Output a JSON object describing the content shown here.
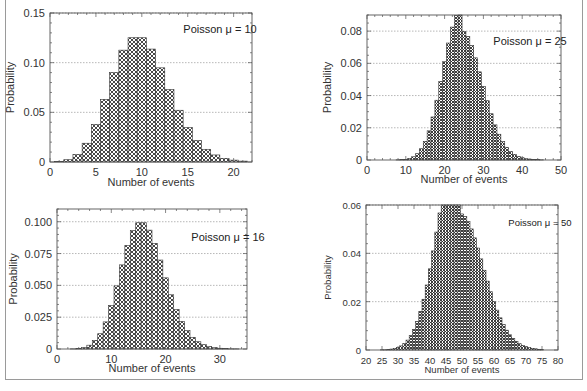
{
  "chart_data": [
    {
      "type": "bar",
      "title": "",
      "annotation": "Poisson μ = 10",
      "mu": 10,
      "xlabel": "Number of events",
      "ylabel": "Probability",
      "xlim": [
        0,
        22
      ],
      "ylim": [
        0,
        0.15
      ],
      "xticks": [
        0,
        5,
        10,
        15,
        20
      ],
      "xtick_labels": [
        "0",
        "5",
        "10",
        "15",
        "20"
      ],
      "yticks": [
        0,
        0.05,
        0.1,
        0.15
      ],
      "ytick_labels": [
        "0",
        "0.05",
        "0.10",
        "0.15"
      ],
      "grid": "horizontal-dotted",
      "x": [
        1,
        2,
        3,
        4,
        5,
        6,
        7,
        8,
        9,
        10,
        11,
        12,
        13,
        14,
        15,
        16,
        17,
        18,
        19,
        20,
        21
      ],
      "values": [
        0.0005,
        0.0023,
        0.0076,
        0.0189,
        0.0378,
        0.0631,
        0.0901,
        0.1126,
        0.1251,
        0.1251,
        0.1137,
        0.0948,
        0.0729,
        0.0521,
        0.0347,
        0.0217,
        0.0128,
        0.0071,
        0.0037,
        0.0019,
        0.0009
      ]
    },
    {
      "type": "bar",
      "title": "",
      "annotation": "Poisson μ = 25",
      "mu": 25,
      "xlabel": "Number of events",
      "ylabel": "Probability",
      "xlim": [
        0,
        50
      ],
      "ylim": [
        0,
        0.09
      ],
      "xticks": [
        0,
        10,
        20,
        30,
        40,
        50
      ],
      "xtick_labels": [
        "0",
        "10",
        "20",
        "30",
        "40",
        "50"
      ],
      "yticks": [
        0,
        0.02,
        0.04,
        0.06,
        0.08
      ],
      "ytick_labels": [
        "0",
        "0.02",
        "0.04",
        "0.06",
        "0.08"
      ],
      "grid": "horizontal-dotted",
      "x": [
        8,
        9,
        10,
        11,
        12,
        13,
        14,
        15,
        16,
        17,
        18,
        19,
        20,
        21,
        22,
        23,
        24,
        25,
        26,
        27,
        28,
        29,
        30,
        31,
        32,
        33,
        34,
        35,
        36,
        37,
        38,
        39,
        40,
        41,
        42,
        43,
        44,
        45
      ],
      "values": [
        0.0001,
        0.0002,
        0.0004,
        0.001,
        0.002,
        0.0039,
        0.007,
        0.0116,
        0.0181,
        0.0267,
        0.0371,
        0.0488,
        0.061,
        0.0726,
        0.0825,
        0.0897,
        0.0934,
        0.0798,
        0.0767,
        0.071,
        0.0634,
        0.0547,
        0.0456,
        0.0368,
        0.0287,
        0.0218,
        0.016,
        0.0114,
        0.0079,
        0.0053,
        0.0035,
        0.0022,
        0.0014,
        0.0008,
        0.0005,
        0.0003,
        0.0002,
        0.0001
      ]
    },
    {
      "type": "bar",
      "title": "",
      "annotation": "Poisson μ = 16",
      "mu": 16,
      "xlabel": "Number of events",
      "ylabel": "Probability",
      "xlim": [
        0,
        35
      ],
      "ylim": [
        0,
        0.11
      ],
      "xticks": [
        0,
        10,
        20,
        30
      ],
      "xtick_labels": [
        "0",
        "10",
        "20",
        "30"
      ],
      "yticks": [
        0,
        0.025,
        0.05,
        0.075,
        0.1
      ],
      "ytick_labels": [
        "0",
        "0.025",
        "0.050",
        "0.075",
        "0.100"
      ],
      "grid": "horizontal-dotted",
      "x": [
        3,
        4,
        5,
        6,
        7,
        8,
        9,
        10,
        11,
        12,
        13,
        14,
        15,
        16,
        17,
        18,
        19,
        20,
        21,
        22,
        23,
        24,
        25,
        26,
        27,
        28,
        29,
        30,
        31,
        32,
        33
      ],
      "values": [
        0.0001,
        0.0004,
        0.0011,
        0.003,
        0.0068,
        0.012,
        0.0213,
        0.0341,
        0.0496,
        0.0661,
        0.0814,
        0.093,
        0.0992,
        0.0992,
        0.0934,
        0.083,
        0.0699,
        0.0559,
        0.0426,
        0.031,
        0.0216,
        0.0144,
        0.0092,
        0.0057,
        0.0034,
        0.0019,
        0.0011,
        0.0006,
        0.0003,
        0.0001,
        0.0001
      ]
    },
    {
      "type": "bar",
      "title": "",
      "annotation": "Poisson μ = 50",
      "mu": 50,
      "xlabel": "Number of events",
      "ylabel": "Probability",
      "xlim": [
        20,
        80
      ],
      "ylim": [
        0,
        0.06
      ],
      "xticks": [
        20,
        25,
        30,
        35,
        40,
        45,
        50,
        55,
        60,
        65,
        70,
        75,
        80
      ],
      "xtick_labels": [
        "20",
        "25",
        "30",
        "35",
        "40",
        "45",
        "50",
        "55",
        "60",
        "65",
        "70",
        "75",
        "80"
      ],
      "yticks": [
        0,
        0.02,
        0.04,
        0.06
      ],
      "ytick_labels": [
        "0",
        "0.02",
        "0.04",
        "0.06"
      ],
      "grid": "horizontal-dotted",
      "x": [
        25,
        26,
        27,
        28,
        29,
        30,
        31,
        32,
        33,
        34,
        35,
        36,
        37,
        38,
        39,
        40,
        41,
        42,
        43,
        44,
        45,
        46,
        47,
        48,
        49,
        50,
        51,
        52,
        53,
        54,
        55,
        56,
        57,
        58,
        59,
        60,
        61,
        62,
        63,
        64,
        65,
        66,
        67,
        68,
        69,
        70,
        71,
        72,
        73,
        74,
        75
      ],
      "values": [
        0.0001,
        0.0001,
        0.0002,
        0.0004,
        0.0007,
        0.0011,
        0.0017,
        0.0027,
        0.0041,
        0.006,
        0.0085,
        0.0118,
        0.016,
        0.021,
        0.0269,
        0.0336,
        0.041,
        0.0488,
        0.0567,
        0.0644,
        0.0716,
        0.0778,
        0.0827,
        0.0862,
        0.088,
        0.0563,
        0.0552,
        0.0531,
        0.0501,
        0.0464,
        0.0422,
        0.0377,
        0.033,
        0.0285,
        0.0241,
        0.0201,
        0.0165,
        0.0133,
        0.0105,
        0.0082,
        0.0063,
        0.0048,
        0.0036,
        0.0026,
        0.0019,
        0.0014,
        0.001,
        0.0007,
        0.0005,
        0.0003,
        0.0002
      ]
    }
  ]
}
